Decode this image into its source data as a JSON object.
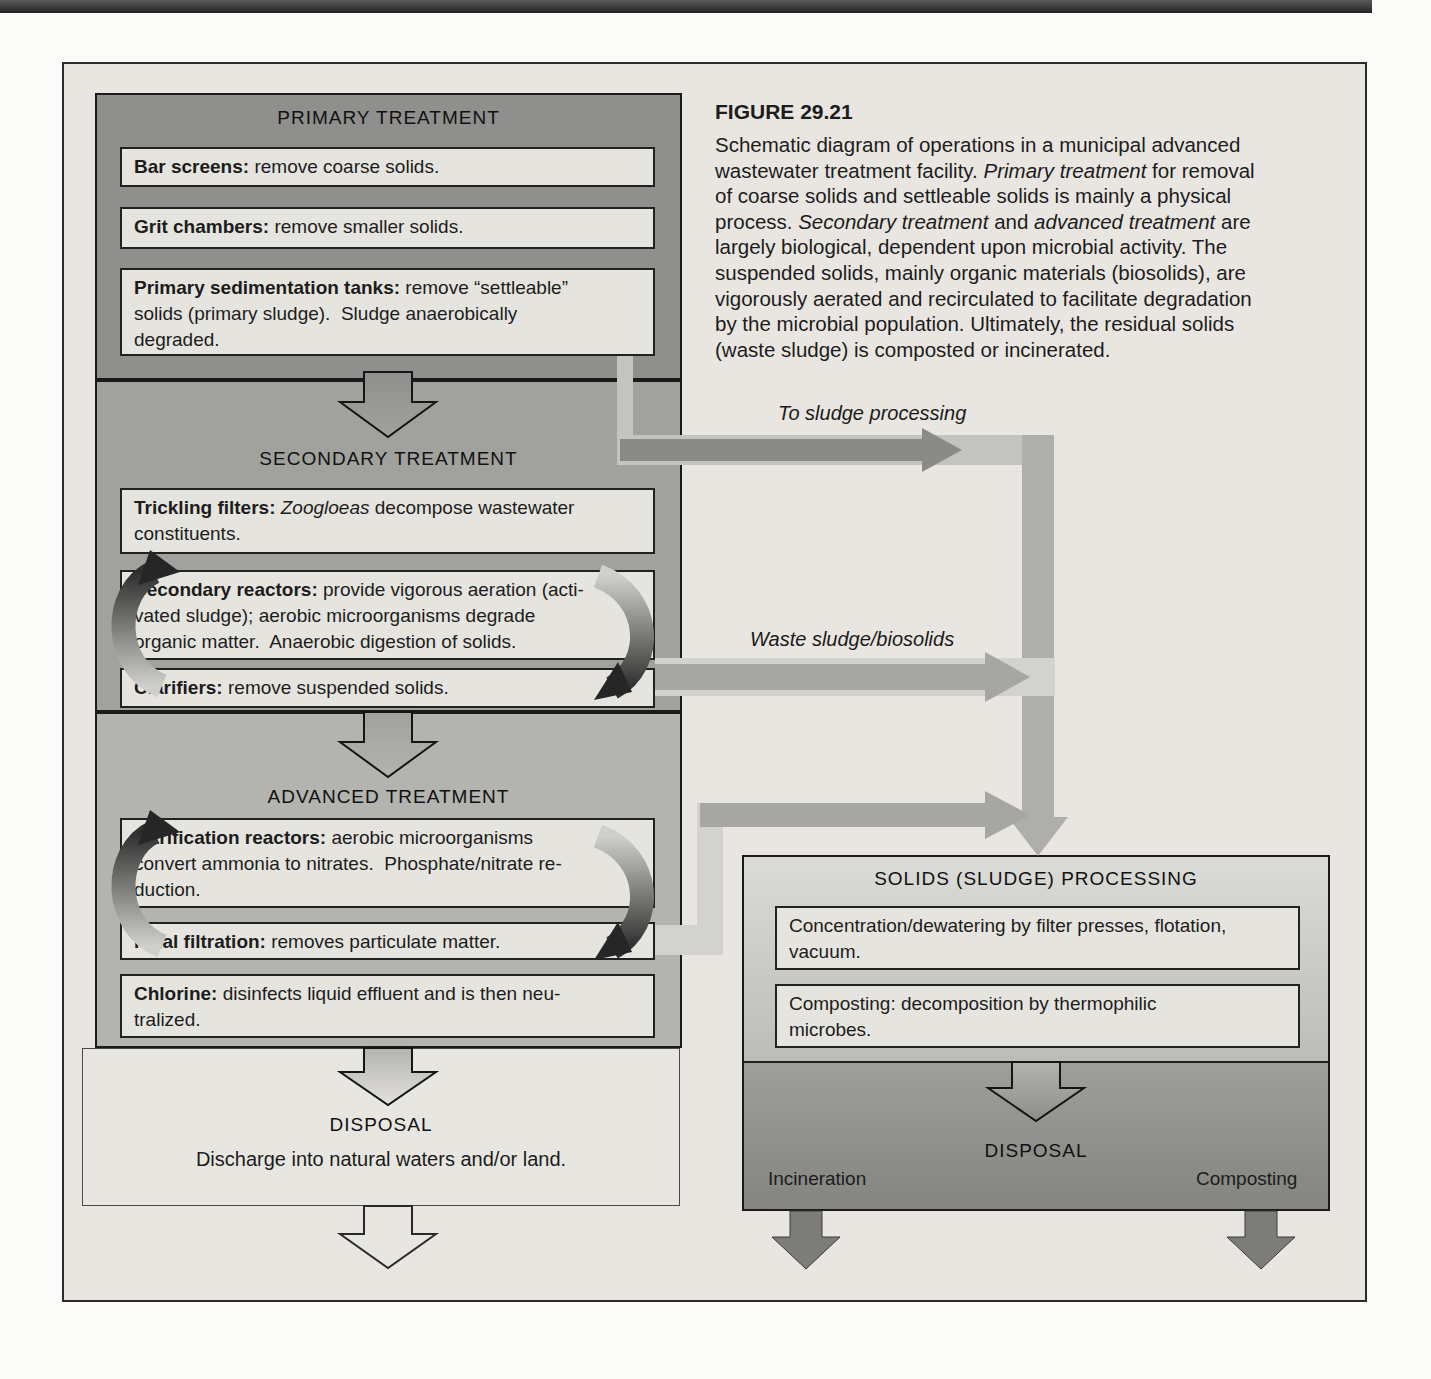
{
  "figure": {
    "title": "FIGURE 29.21",
    "caption_segments": [
      {
        "style": "normal",
        "text": "Schematic diagram of operations in a municipal advanced\nwastewater treatment facility. "
      },
      {
        "style": "italic",
        "text": "Primary treatment"
      },
      {
        "style": "normal",
        "text": " for removal\nof coarse solids and settleable solids is mainly a physical\nprocess. "
      },
      {
        "style": "italic",
        "text": "Secondary treatment"
      },
      {
        "style": "normal",
        "text": " and "
      },
      {
        "style": "italic",
        "text": "advanced treatment"
      },
      {
        "style": "normal",
        "text": " are\nlargely biological, dependent upon microbial activity. The\nsuspended solids, mainly organic materials (biosolids), are\nvigorously aerated and recirculated to facilitate degradation\nby the microbial population. Ultimately, the residual solids\n(waste sludge) is composted or incinerated."
      }
    ]
  },
  "primary": {
    "title": "PRIMARY TREATMENT",
    "boxes": [
      [
        {
          "style": "bold",
          "text": "Bar screens:"
        },
        {
          "style": "normal",
          "text": " remove coarse solids."
        }
      ],
      [
        {
          "style": "bold",
          "text": "Grit chambers:"
        },
        {
          "style": "normal",
          "text": " remove smaller solids."
        }
      ],
      [
        {
          "style": "bold",
          "text": "Primary sedimentation tanks:"
        },
        {
          "style": "normal",
          "text": " remove “settleable”\nsolids (primary sludge).  Sludge anaerobically\ndegraded."
        }
      ]
    ]
  },
  "secondary": {
    "title": "SECONDARY TREATMENT",
    "boxes": [
      [
        {
          "style": "bold",
          "text": "Trickling filters:"
        },
        {
          "style": "normal",
          "text": " "
        },
        {
          "style": "italic",
          "text": "Zoogloeas"
        },
        {
          "style": "normal",
          "text": " decompose wastewater\nconstituents."
        }
      ],
      [
        {
          "style": "bold",
          "text": "Secondary reactors:"
        },
        {
          "style": "normal",
          "text": " provide vigorous aeration (acti-\nvated sludge); aerobic microorganisms degrade\norganic matter.  Anaerobic digestion of solids."
        }
      ],
      [
        {
          "style": "bold",
          "text": "Clarifiers:"
        },
        {
          "style": "normal",
          "text": " remove suspended solids."
        }
      ]
    ]
  },
  "advanced": {
    "title": "ADVANCED TREATMENT",
    "boxes": [
      [
        {
          "style": "bold",
          "text": "Nitrification reactors:"
        },
        {
          "style": "normal",
          "text": " aerobic microorganisms\nconvert ammonia to nitrates.  Phosphate/nitrate re-\nduction."
        }
      ],
      [
        {
          "style": "bold",
          "text": "Final filtration:"
        },
        {
          "style": "normal",
          "text": " removes particulate matter."
        }
      ],
      [
        {
          "style": "bold",
          "text": "Chlorine:"
        },
        {
          "style": "normal",
          "text": " disinfects liquid effluent and is then neu-\ntralized."
        }
      ]
    ]
  },
  "disposal_left": {
    "title": "DISPOSAL",
    "text": "Discharge into natural waters and/or land."
  },
  "flow_labels": {
    "to_sludge": "To sludge processing",
    "waste_sludge": "Waste sludge/biosolids"
  },
  "solids": {
    "title": "SOLIDS (SLUDGE) PROCESSING",
    "boxes": [
      [
        {
          "style": "normal",
          "text": "Concentration/dewatering by filter presses, flotation,\nvacuum."
        }
      ],
      [
        {
          "style": "normal",
          "text": "Composting: decomposition by thermophilic\nmicrobes."
        }
      ]
    ],
    "disposal_title": "DISPOSAL",
    "left_label": "Incineration",
    "right_label": "Composting"
  },
  "colors": {
    "panel_bg": "#e9e6e1",
    "primary_container": "#8f8f8d",
    "secondary_container": "#a1a19e",
    "advanced_container": "#b3b3b0",
    "process_box_bg": "#e6e4df",
    "dark_arrow": "#8a8a87",
    "mid_arrow": "#a6a6a3",
    "light_band": "#c3c3bf",
    "solids_disposal_band": "#8f8f8c"
  }
}
